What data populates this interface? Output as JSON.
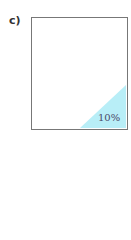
{
  "figure": {
    "label": "c)",
    "shaded_region": {
      "shape": "right-triangle",
      "corner": "bottom-right",
      "color": "#b8eef7",
      "percentage_label": "10%"
    }
  }
}
